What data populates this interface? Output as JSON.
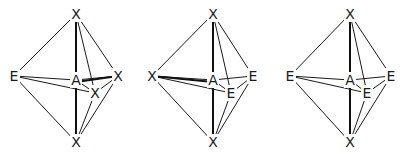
{
  "diagrams": [
    {
      "name": "bipyramid-1",
      "vertices": {
        "top": {
          "label": "X",
          "x": 76,
          "y": 14
        },
        "bottom": {
          "label": "X",
          "x": 76,
          "y": 142
        },
        "left": {
          "label": "E",
          "x": 14,
          "y": 76
        },
        "right": {
          "label": "X",
          "x": 118,
          "y": 76
        },
        "front": {
          "label": "X",
          "x": 95,
          "y": 93
        },
        "center": {
          "label": "A",
          "x": 76,
          "y": 80
        }
      }
    },
    {
      "name": "bipyramid-2",
      "vertices": {
        "top": {
          "label": "X",
          "x": 213,
          "y": 14
        },
        "bottom": {
          "label": "X",
          "x": 213,
          "y": 142
        },
        "left": {
          "label": "X",
          "x": 152,
          "y": 76
        },
        "right": {
          "label": "E",
          "x": 253,
          "y": 76
        },
        "front": {
          "label": "E",
          "x": 231,
          "y": 93
        },
        "center": {
          "label": "A",
          "x": 213,
          "y": 80
        }
      }
    },
    {
      "name": "bipyramid-3",
      "vertices": {
        "top": {
          "label": "X",
          "x": 350,
          "y": 14
        },
        "bottom": {
          "label": "X",
          "x": 350,
          "y": 142
        },
        "left": {
          "label": "E",
          "x": 290,
          "y": 76
        },
        "right": {
          "label": "E",
          "x": 391,
          "y": 76
        },
        "front": {
          "label": "E",
          "x": 367,
          "y": 93
        },
        "center": {
          "label": "A",
          "x": 350,
          "y": 80
        }
      }
    }
  ]
}
